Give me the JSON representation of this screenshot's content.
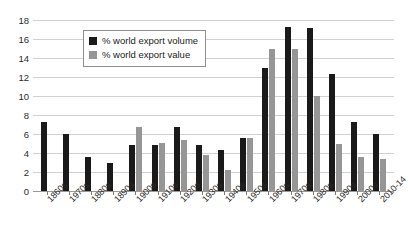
{
  "chart_data": {
    "type": "bar",
    "title": "",
    "subtitle": "",
    "xlabel": "",
    "ylabel": "",
    "ylim": [
      0,
      18
    ],
    "ytick_step": 2,
    "yticks": [
      18,
      16,
      14,
      12,
      10,
      8,
      6,
      4,
      2,
      0
    ],
    "grid": true,
    "legend_position": "top-left-inside",
    "categories": [
      "1860s",
      "1970s",
      "1880s",
      "1890s",
      "1900s",
      "1910s",
      "1920s",
      "1930s",
      "1940s",
      "1950s",
      "1960s",
      "1970s",
      "1980s",
      "1990s",
      "2000s",
      "2010-14"
    ],
    "series": [
      {
        "name": "% world export volume",
        "color": "#1a1a1a",
        "values": [
          7.3,
          6.0,
          3.6,
          2.9,
          4.8,
          4.8,
          6.7,
          4.8,
          4.3,
          5.6,
          12.9,
          17.3,
          17.2,
          12.3,
          7.3,
          6.0
        ]
      },
      {
        "name": "% world export value",
        "color": "#969696",
        "values": [
          null,
          null,
          null,
          null,
          6.7,
          5.1,
          5.4,
          3.8,
          2.2,
          5.6,
          14.9,
          15.0,
          10.0,
          5.0,
          3.6,
          3.4
        ]
      }
    ]
  },
  "legend": {
    "items": [
      {
        "label": "% world export volume",
        "swatch": "volume"
      },
      {
        "label": "% world export value",
        "swatch": "value"
      }
    ]
  }
}
